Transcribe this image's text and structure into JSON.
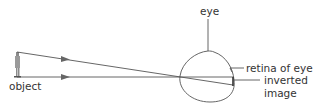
{
  "diagram": {
    "type": "optics-ray-diagram",
    "labels": {
      "object": "object",
      "eye": "eye",
      "retina": "retina of eye",
      "inverted_line1": "inverted",
      "inverted_line2": "image"
    },
    "colors": {
      "line": "#555555",
      "arrow": "#666666",
      "text": "#333333",
      "object_figure": "#7a7a7a"
    },
    "rays": [
      {
        "name": "ray-from-top",
        "from": [
          17,
          52
        ],
        "to": [
          233,
          85
        ]
      },
      {
        "name": "ray-from-base",
        "from": [
          17,
          77
        ],
        "to": [
          233,
          77
        ]
      }
    ]
  }
}
